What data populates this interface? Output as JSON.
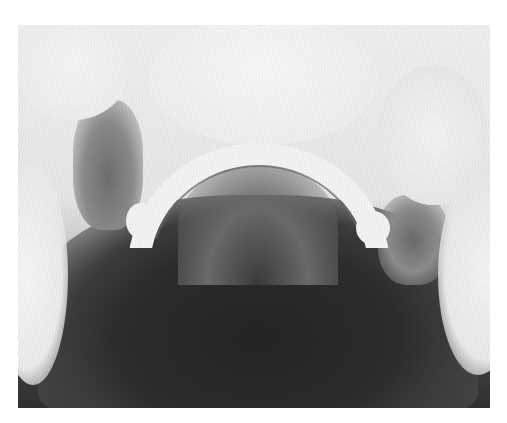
{
  "image": {
    "description": "Grayscale occlusal dental radiograph showing a curved dental arch with teeth and darker soft tissue region below",
    "frame": {
      "left": 18,
      "top": 25,
      "width": 472,
      "height": 383
    },
    "colors": {
      "background": "#ffffff",
      "light_tone": "#efefef",
      "dark_tone": "#2a2a2a"
    }
  }
}
